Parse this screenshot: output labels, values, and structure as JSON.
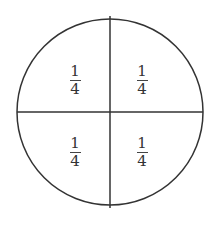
{
  "diagram": {
    "stroke_color": "#333333",
    "parts": [
      {
        "position": "top-left",
        "numerator": "1",
        "denominator": "4"
      },
      {
        "position": "top-right",
        "numerator": "1",
        "denominator": "4"
      },
      {
        "position": "bottom-left",
        "numerator": "1",
        "denominator": "4"
      },
      {
        "position": "bottom-right",
        "numerator": "1",
        "denominator": "4"
      }
    ]
  }
}
